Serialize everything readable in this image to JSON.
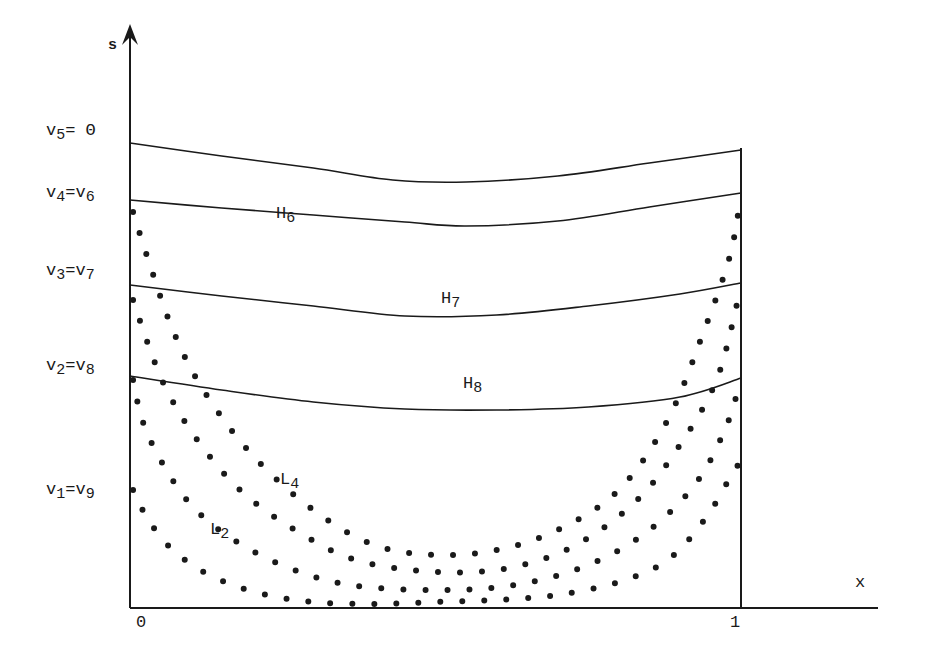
{
  "axes": {
    "y_label": "s",
    "x_label": "x",
    "x_ticks": [
      {
        "label": "0",
        "x": 0
      },
      {
        "label": "1",
        "x": 1
      }
    ]
  },
  "level_labels": [
    {
      "main": "v",
      "sub": "5",
      "rest": "= Θ",
      "top": 122
    },
    {
      "main": "v",
      "sub": "4",
      "rest": "=v",
      "sub2": "6",
      "top": 184
    },
    {
      "main": "v",
      "sub": "3",
      "rest": "=v",
      "sub2": "7",
      "top": 262
    },
    {
      "main": "v",
      "sub": "2",
      "rest": "=v",
      "sub2": "8",
      "top": 357
    },
    {
      "main": "v",
      "sub": "1",
      "rest": "=v",
      "sub2": "9",
      "top": 481
    }
  ],
  "curve_labels": [
    {
      "main": "H",
      "sub": "6",
      "left": 276,
      "top": 205
    },
    {
      "main": "H",
      "sub": "7",
      "left": 441,
      "top": 290
    },
    {
      "main": "H",
      "sub": "8",
      "left": 463,
      "top": 375
    },
    {
      "main": "L",
      "sub": "4",
      "left": 280,
      "top": 471
    },
    {
      "main": "L",
      "sub": "2",
      "left": 210,
      "top": 521
    }
  ],
  "chart_data": {
    "type": "line",
    "title": "",
    "xlabel": "x",
    "ylabel": "s",
    "xlim": [
      0,
      1
    ],
    "y_levels": [
      "v1=v9",
      "v2=v8",
      "v3=v7",
      "v4=v6",
      "v5=Θ"
    ],
    "series": [
      {
        "name": "Θ (top solid curve)",
        "style": "solid",
        "points": [
          [
            0,
            143
          ],
          [
            0.15,
            156
          ],
          [
            0.3,
            168
          ],
          [
            0.43,
            180
          ],
          [
            0.55,
            182
          ],
          [
            0.7,
            176
          ],
          [
            0.85,
            163
          ],
          [
            1,
            150
          ]
        ]
      },
      {
        "name": "H6",
        "style": "solid",
        "points": [
          [
            0,
            200
          ],
          [
            0.15,
            208
          ],
          [
            0.3,
            215
          ],
          [
            0.45,
            222
          ],
          [
            0.55,
            226
          ],
          [
            0.7,
            221
          ],
          [
            0.85,
            207
          ],
          [
            1,
            193
          ]
        ]
      },
      {
        "name": "H7",
        "style": "solid",
        "points": [
          [
            0,
            285
          ],
          [
            0.15,
            296
          ],
          [
            0.3,
            306
          ],
          [
            0.45,
            316
          ],
          [
            0.6,
            315
          ],
          [
            0.75,
            306
          ],
          [
            0.9,
            294
          ],
          [
            1,
            283
          ]
        ]
      },
      {
        "name": "H8",
        "style": "solid",
        "points": [
          [
            0,
            376
          ],
          [
            0.15,
            390
          ],
          [
            0.3,
            402
          ],
          [
            0.45,
            409
          ],
          [
            0.6,
            410
          ],
          [
            0.75,
            407
          ],
          [
            0.9,
            397
          ],
          [
            1,
            378
          ]
        ]
      },
      {
        "name": "dotted curve 1 (innermost)",
        "style": "dotted",
        "points": [
          [
            0.005,
            212
          ],
          [
            0.03,
            260
          ],
          [
            0.07,
            330
          ],
          [
            0.12,
            390
          ],
          [
            0.2,
            455
          ],
          [
            0.3,
            510
          ],
          [
            0.4,
            545
          ],
          [
            0.5,
            555
          ],
          [
            0.6,
            550
          ],
          [
            0.7,
            530
          ],
          [
            0.8,
            490
          ],
          [
            0.88,
            420
          ],
          [
            0.94,
            330
          ],
          [
            0.98,
            260
          ],
          [
            0.995,
            215
          ]
        ]
      },
      {
        "name": "dotted curve 2",
        "style": "dotted",
        "points": [
          [
            0.005,
            300
          ],
          [
            0.03,
            345
          ],
          [
            0.06,
            390
          ],
          [
            0.11,
            440
          ],
          [
            0.18,
            490
          ],
          [
            0.27,
            530
          ],
          [
            0.37,
            560
          ],
          [
            0.5,
            572
          ],
          [
            0.62,
            568
          ],
          [
            0.73,
            545
          ],
          [
            0.83,
            500
          ],
          [
            0.9,
            445
          ],
          [
            0.96,
            380
          ],
          [
            0.995,
            300
          ]
        ]
      },
      {
        "name": "L4",
        "style": "dotted",
        "points": [
          [
            0.005,
            380
          ],
          [
            0.02,
            420
          ],
          [
            0.05,
            460
          ],
          [
            0.1,
            505
          ],
          [
            0.17,
            540
          ],
          [
            0.26,
            568
          ],
          [
            0.36,
            585
          ],
          [
            0.5,
            590
          ],
          [
            0.63,
            585
          ],
          [
            0.75,
            565
          ],
          [
            0.85,
            530
          ],
          [
            0.93,
            480
          ],
          [
            0.98,
            420
          ],
          [
            0.998,
            380
          ]
        ]
      },
      {
        "name": "L2",
        "style": "dotted",
        "points": [
          [
            0.005,
            490
          ],
          [
            0.03,
            520
          ],
          [
            0.07,
            550
          ],
          [
            0.13,
            575
          ],
          [
            0.21,
            593
          ],
          [
            0.3,
            602
          ],
          [
            0.4,
            604
          ],
          [
            0.5,
            602
          ],
          [
            0.6,
            600
          ],
          [
            0.7,
            595
          ],
          [
            0.8,
            582
          ],
          [
            0.88,
            560
          ],
          [
            0.94,
            520
          ],
          [
            0.98,
            480
          ],
          [
            0.998,
            462
          ]
        ]
      }
    ]
  }
}
